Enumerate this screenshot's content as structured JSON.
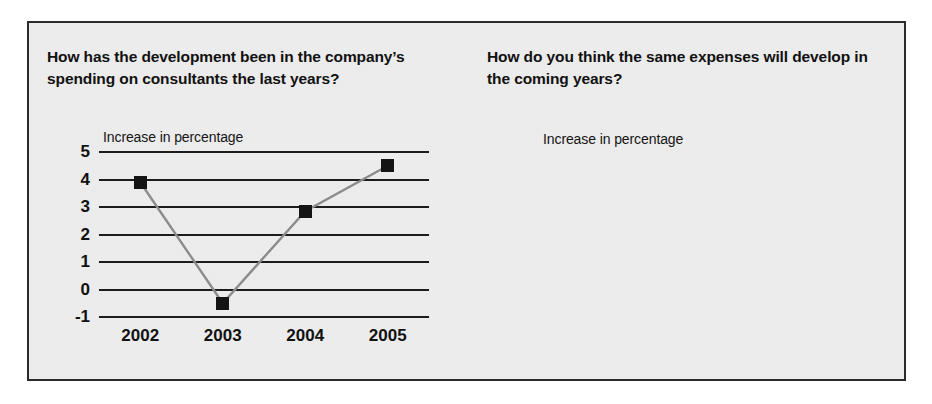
{
  "panel": {
    "background_color": "#e9e9e9",
    "border_color": "#2b2b2b"
  },
  "charts": {
    "left": {
      "title": "How has the development been in the company’s spending on consultants the last years?",
      "axis_caption": "Increase in percentage",
      "ytick_labels": [
        "5",
        "4",
        "3",
        "2",
        "1",
        "0",
        "-1"
      ],
      "xtick_labels": [
        "2002",
        "2003",
        "2004",
        "2005"
      ]
    },
    "right": {
      "title": "How do you think the same expenses will develop in the coming years?",
      "axis_caption": "Increase in percentage",
      "ytick_labels": [
        "0",
        "-1",
        "-2",
        "-3",
        "-4"
      ],
      "xtick_labels": [
        "2002",
        "2003",
        "2004",
        "2005"
      ]
    }
  },
  "chart_data": [
    {
      "id": "left",
      "type": "line",
      "title": "How has the development been in the company’s spending on consultants the last years?",
      "xlabel": "",
      "ylabel": "Increase in percentage",
      "categories": [
        "2002",
        "2003",
        "2004",
        "2005"
      ],
      "values": [
        3.9,
        -0.5,
        2.85,
        4.5
      ],
      "ylim": [
        -1,
        5
      ],
      "yticks": [
        5,
        4,
        3,
        2,
        1,
        0,
        -1
      ],
      "grid": true,
      "legend": "none",
      "marker": "square",
      "marker_color": "#141414",
      "line_color": "#8c8c8c"
    },
    {
      "id": "right",
      "type": "line",
      "title": "How do you think the same expenses will develop in the coming years?",
      "xlabel": "",
      "ylabel": "Increase in percentage",
      "categories": [
        "2002",
        "2003",
        "2004",
        "2005"
      ],
      "values": [
        -2.35,
        -3.6,
        -3.4,
        -1.2
      ],
      "ylim": [
        -4,
        0
      ],
      "yticks": [
        0,
        -1,
        -2,
        -3,
        -4
      ],
      "grid": true,
      "legend": "none",
      "marker": "square",
      "marker_color": "#141414",
      "line_color": "#8c8c8c"
    }
  ]
}
